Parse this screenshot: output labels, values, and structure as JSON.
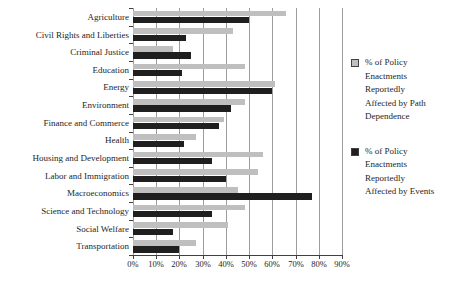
{
  "chart_data": {
    "type": "bar",
    "orientation": "horizontal",
    "title": "",
    "categories": [
      "Agriculture",
      "Civil Rights and Liberties",
      "Criminal Justice",
      "Education",
      "Energy",
      "Environment",
      "Finance and Commerce",
      "Health",
      "Housing and Development",
      "Labor and Immigration",
      "Macroeconomics",
      "Science and Technology",
      "Social Welfare",
      "Transportation"
    ],
    "series": [
      {
        "name": "% of Policy Enactments Reportedly Affected by Path Dependence",
        "color": "#bfbfbf",
        "legend_lines": [
          "% of Policy",
          "Enactments",
          "Reportedly",
          "Affected by Path",
          "Dependence"
        ],
        "values": [
          66,
          43,
          17,
          48,
          61,
          48,
          39,
          27,
          56,
          54,
          45,
          48,
          41,
          27
        ]
      },
      {
        "name": "% of Policy Enactments Reportedly Affected by Events",
        "color": "#1f1f1f",
        "legend_lines": [
          "% of Policy",
          "Enactments",
          "Reportedly",
          "Affected by Events"
        ],
        "values": [
          50,
          23,
          25,
          21,
          60,
          42,
          37,
          22,
          34,
          40,
          77,
          34,
          17,
          20
        ]
      }
    ],
    "x_ticks": [
      "0%",
      "10%",
      "20%",
      "30%",
      "40%",
      "50%",
      "60%",
      "70%",
      "80%",
      "90%"
    ],
    "xlim": [
      0,
      90
    ],
    "grid": "vertical",
    "legend_position": "right",
    "gridline_color": "#9c9c9c",
    "axis_color": "#404040",
    "text_color": "#262626",
    "background": "#ffffff"
  }
}
